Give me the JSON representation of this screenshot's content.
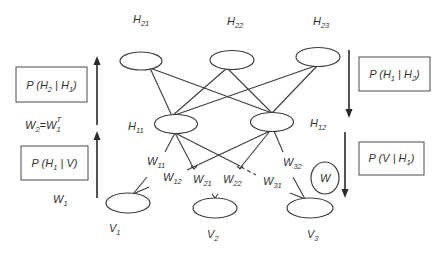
{
  "diagram": {
    "hidden_layer_2": {
      "nodes": [
        {
          "label": "H",
          "sub": "21"
        },
        {
          "label": "H",
          "sub": "22"
        },
        {
          "label": "H",
          "sub": "23"
        }
      ]
    },
    "hidden_layer_1": {
      "nodes": [
        {
          "label": "H",
          "sub": "11"
        },
        {
          "label": "H",
          "sub": "12"
        }
      ]
    },
    "visible_layer": {
      "nodes": [
        {
          "label": "V",
          "sub": "1"
        },
        {
          "label": "V",
          "sub": "2"
        },
        {
          "label": "V",
          "sub": "3"
        }
      ]
    },
    "weight_labels": [
      {
        "label": "W",
        "sub": "11"
      },
      {
        "label": "W",
        "sub": "12"
      },
      {
        "label": "W",
        "sub": "21"
      },
      {
        "label": "W",
        "sub": "22"
      },
      {
        "label": "W",
        "sub": "31"
      },
      {
        "label": "W",
        "sub": "32"
      }
    ],
    "weight_node": {
      "label": "W"
    },
    "left_panel": {
      "upper_box": {
        "p": "P (",
        "a": "H",
        "a_sub": "2",
        "sep": " | ",
        "b": "H",
        "b_sub": "1",
        "close": ")"
      },
      "tie_label": {
        "w2": "W",
        "w2_sub": "2",
        "eq": "=",
        "w1": "W",
        "w1_sub": "1",
        "w1_sup": "T"
      },
      "lower_box": {
        "p": "P (",
        "a": "H",
        "a_sub": "1",
        "sep": " | ",
        "b": "V",
        "close": ")"
      },
      "w1_label": {
        "label": "W",
        "sub": "1"
      },
      "arrow_direction": "up"
    },
    "right_panel": {
      "upper_box": {
        "p": "P (",
        "a": "H",
        "a_sub": "1",
        "sep": " | ",
        "b": "H",
        "b_sub": "2",
        "close": ")"
      },
      "lower_box": {
        "p": "P (",
        "a": "V",
        "sep": " | ",
        "b": "H",
        "b_sub": "1",
        "close": ")"
      },
      "arrow_direction": "down"
    }
  },
  "colors": {
    "stroke": "#3c3c3c",
    "text": "#333333",
    "background": "#ffffff"
  }
}
